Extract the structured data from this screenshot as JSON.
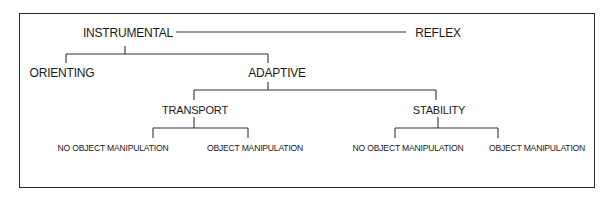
{
  "diagram": {
    "type": "hierarchy-tree",
    "nodes": {
      "instrumental": "INSTRUMENTAL",
      "reflex": "REFLEX",
      "orienting": "ORIENTING",
      "adaptive": "ADAPTIVE",
      "transport": "TRANSPORT",
      "stability": "STABILITY",
      "transport_no_object": "NO OBJECT MANIPULATION",
      "transport_object": "OBJECT MANIPULATION",
      "stability_no_object": "NO OBJECT MANIPULATION",
      "stability_object": "OBJECT MANIPULATION"
    },
    "edges": [
      [
        "INSTRUMENTAL",
        "REFLEX"
      ],
      [
        "INSTRUMENTAL",
        "ORIENTING"
      ],
      [
        "INSTRUMENTAL",
        "ADAPTIVE"
      ],
      [
        "ADAPTIVE",
        "TRANSPORT"
      ],
      [
        "ADAPTIVE",
        "STABILITY"
      ],
      [
        "TRANSPORT",
        "NO OBJECT MANIPULATION"
      ],
      [
        "TRANSPORT",
        "OBJECT MANIPULATION"
      ],
      [
        "STABILITY",
        "NO OBJECT MANIPULATION"
      ],
      [
        "STABILITY",
        "OBJECT MANIPULATION"
      ]
    ],
    "colors": {
      "line": "#333333",
      "text": "#1a1a1a",
      "background": "#ffffff"
    }
  }
}
